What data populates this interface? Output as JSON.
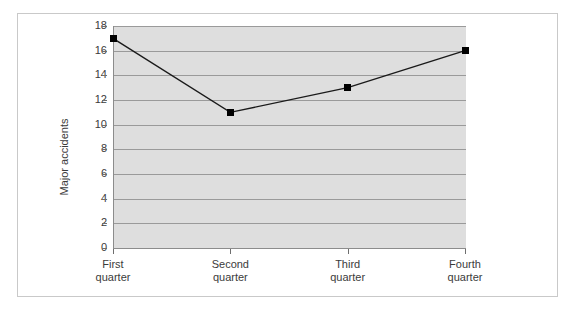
{
  "chart_data": {
    "type": "line",
    "title": "",
    "xlabel": "",
    "ylabel": "Major accidents",
    "categories": [
      "First quarter",
      "Second quarter",
      "Third quarter",
      "Fourth quarter"
    ],
    "category_lines": [
      [
        "First",
        "quarter"
      ],
      [
        "Second",
        "quarter"
      ],
      [
        "Third",
        "quarter"
      ],
      [
        "Fourth",
        "quarter"
      ]
    ],
    "values": [
      17,
      11,
      13,
      16
    ],
    "series": [
      {
        "name": "Major accidents",
        "values": [
          17,
          11,
          13,
          16
        ]
      }
    ],
    "ylim": [
      0,
      18
    ],
    "ytick_step": 2,
    "yticks": [
      0,
      2,
      4,
      6,
      8,
      10,
      12,
      14,
      16,
      18
    ],
    "ytick_labels": [
      "0",
      "2",
      "4",
      "6",
      "8",
      "10",
      "12",
      "14",
      "16",
      "18"
    ],
    "grid": "horizontal",
    "legend": "none",
    "marker": "square",
    "colors": {
      "plot_background": "#dedede",
      "gridline": "#9a9a9a",
      "axis": "#8c8c8c",
      "line": "#1a1a1a",
      "marker": "#000000",
      "text": "#3b3b3b",
      "frame": "#c9c9c9",
      "page_background": "#ffffff"
    }
  }
}
